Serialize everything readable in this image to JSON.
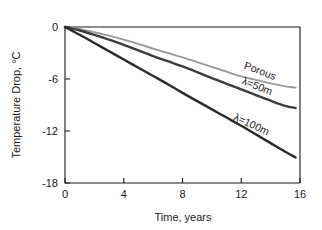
{
  "chart_data": {
    "type": "line",
    "title": "",
    "xlabel": "Time, years",
    "ylabel": "Temperature Drop, °C",
    "xlim": [
      0,
      16
    ],
    "ylim": [
      -18,
      0
    ],
    "xticks": [
      "0",
      "4",
      "8",
      "12",
      "16"
    ],
    "yticks": [
      "0",
      "-6",
      "-12",
      "-18"
    ],
    "xtick_values": [
      0,
      4,
      8,
      12,
      16
    ],
    "ytick_values": [
      0,
      -6,
      -12,
      -18
    ],
    "grid": false,
    "legend_position": "inline-annotations",
    "x": [
      0,
      1,
      2,
      3,
      4,
      5,
      6,
      7,
      8,
      9,
      10,
      11,
      12,
      13,
      14,
      15,
      15.7
    ],
    "series": [
      {
        "name": "Porous",
        "color": "#9a9a9a",
        "width": 1.9,
        "values": [
          0,
          -0.25,
          -0.6,
          -1.0,
          -1.45,
          -1.95,
          -2.5,
          -3.0,
          -3.5,
          -4.05,
          -4.6,
          -5.15,
          -5.7,
          -6.1,
          -6.5,
          -6.85,
          -7.0
        ]
      },
      {
        "name": "λ=50m",
        "color": "#3c3c3c",
        "width": 2.4,
        "values": [
          0,
          -0.4,
          -0.9,
          -1.45,
          -2.05,
          -2.7,
          -3.35,
          -3.95,
          -4.55,
          -5.2,
          -5.9,
          -6.55,
          -7.2,
          -7.85,
          -8.5,
          -9.1,
          -9.35
        ]
      },
      {
        "name": "λ=100m",
        "color": "#2a2a2a",
        "width": 2.4,
        "values": [
          0,
          -0.9,
          -1.85,
          -2.8,
          -3.75,
          -4.7,
          -5.65,
          -6.6,
          -7.6,
          -8.55,
          -9.5,
          -10.45,
          -11.4,
          -12.4,
          -13.4,
          -14.4,
          -15.05
        ]
      }
    ],
    "annotations": [
      {
        "text": "Porous",
        "x": 13.2,
        "y": -5.45,
        "rotation": 21,
        "color": "#1a1a1a"
      },
      {
        "text": "λ=50m",
        "x": 13.0,
        "y": -7.2,
        "rotation": 22,
        "color": "#1a1a1a"
      },
      {
        "text": "λ=100m",
        "x": 12.6,
        "y": -11.6,
        "rotation": 25,
        "color": "#1a1a1a"
      }
    ]
  }
}
